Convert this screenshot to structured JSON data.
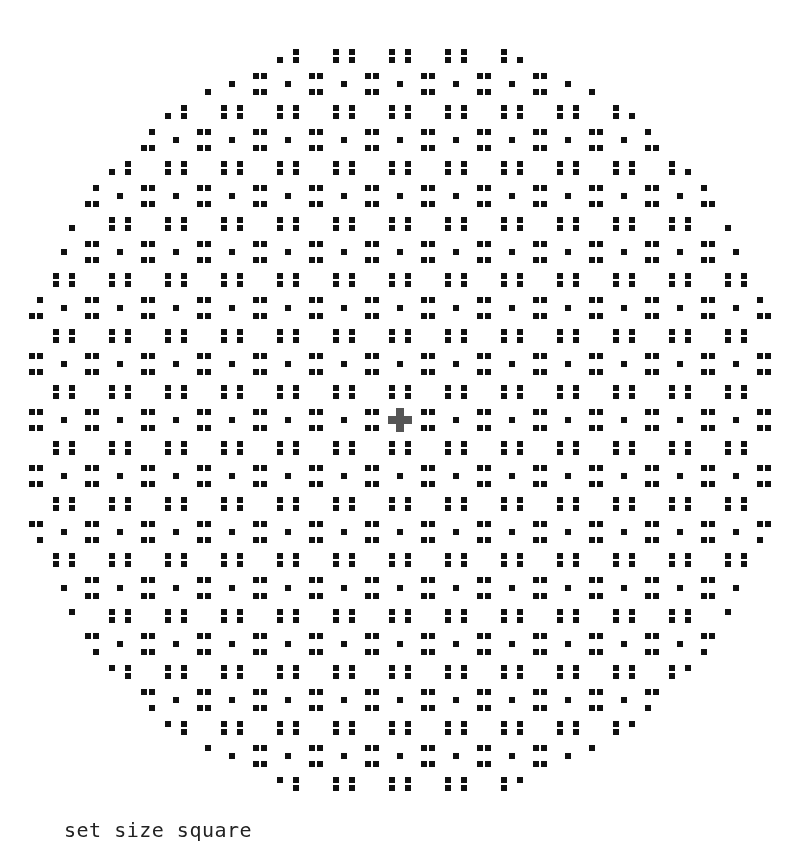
{
  "caption": {
    "text": "set size square"
  },
  "pattern": {
    "description": "Circular disc of black square pixels on white background with 8-fold symmetric lattice pattern (procedural approximation, not a per-pixel transcription)",
    "center_x": 400,
    "center_y": 420,
    "cell_spacing": 8,
    "cell_size": 6,
    "radius_cells": 48,
    "modulus": 7,
    "residues_on": [
      0,
      3
    ],
    "foreground_color": "#111111",
    "background_color": "#ffffff",
    "center_blur_color": "#555555"
  }
}
